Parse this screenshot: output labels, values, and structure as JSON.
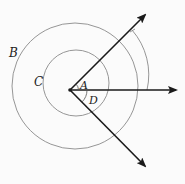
{
  "diagram": {
    "labels": {
      "B": "B",
      "C": "C",
      "A": "A",
      "D": "D"
    },
    "colors": {
      "ray": "#1a1a1a",
      "circle": "#8a8a8a",
      "text": "#222222"
    }
  }
}
